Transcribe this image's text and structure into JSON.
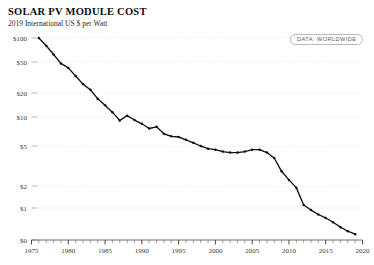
{
  "header": {
    "title": "SOLAR PV MODULE COST",
    "subtitle": "2019 International US $ per Watt",
    "badge_label": "DATA: WORLDWIDE"
  },
  "chart_data": {
    "type": "line",
    "title": "SOLAR PV MODULE COST",
    "subtitle": "2019 International US $ per Watt",
    "xlabel": "",
    "ylabel": "2019 International US $ per Watt",
    "yscale": "log-like",
    "xlim": [
      1975,
      2020
    ],
    "ylim": [
      0,
      100
    ],
    "grid": true,
    "legend_position": "top-right",
    "annotations": [
      "DATA: WORLDWIDE"
    ],
    "ytick_labels": [
      "$100",
      "$50",
      "$20",
      "$10",
      "$5",
      "$2",
      "$1",
      "$0"
    ],
    "ytick_values": [
      100,
      50,
      20,
      10,
      5,
      2,
      1,
      0
    ],
    "xtick_labels": [
      "1975",
      "1980",
      "1985",
      "1990",
      "1995",
      "2000",
      "2005",
      "2010",
      "2015",
      "2020"
    ],
    "xtick_values": [
      1975,
      1980,
      1985,
      1990,
      1995,
      2000,
      2005,
      2010,
      2015,
      2020
    ],
    "x": [
      1976,
      1977,
      1978,
      1979,
      1980,
      1981,
      1982,
      1983,
      1984,
      1985,
      1986,
      1987,
      1988,
      1989,
      1990,
      1991,
      1992,
      1993,
      1994,
      1995,
      1996,
      1997,
      1998,
      1999,
      2000,
      2001,
      2002,
      2003,
      2004,
      2005,
      2006,
      2007,
      2008,
      2009,
      2010,
      2011,
      2012,
      2013,
      2014,
      2015,
      2016,
      2017,
      2018,
      2019
    ],
    "values": [
      106.0,
      80.0,
      62.0,
      48.0,
      42.0,
      33.0,
      26.0,
      22.0,
      17.0,
      14.0,
      11.5,
      9.2,
      10.4,
      9.3,
      8.5,
      7.6,
      7.9,
      6.7,
      6.3,
      6.2,
      5.8,
      5.4,
      5.0,
      4.7,
      4.6,
      4.4,
      4.3,
      4.3,
      4.4,
      4.6,
      4.6,
      4.3,
      3.8,
      2.8,
      2.3,
      1.9,
      1.1,
      0.95,
      0.85,
      0.78,
      0.7,
      0.62,
      0.56,
      0.52
    ],
    "series_name": "Solar PV module cost",
    "line_color": "#111111",
    "grid_color": "#dcdcdc"
  }
}
